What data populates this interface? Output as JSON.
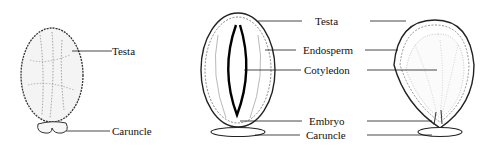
{
  "figures": [
    {
      "id": "external",
      "labels": {
        "testa": "Testa",
        "caruncle": "Caruncle"
      }
    },
    {
      "id": "longitudinal-section",
      "labels": {
        "testa": "Testa",
        "endosperm": "Endosperm",
        "cotyledon": "Cotyledon",
        "embryo": "Embryo",
        "caruncle": "Caruncle"
      }
    }
  ],
  "colors": {
    "line": "#1a1a1a",
    "background": "#ffffff"
  }
}
